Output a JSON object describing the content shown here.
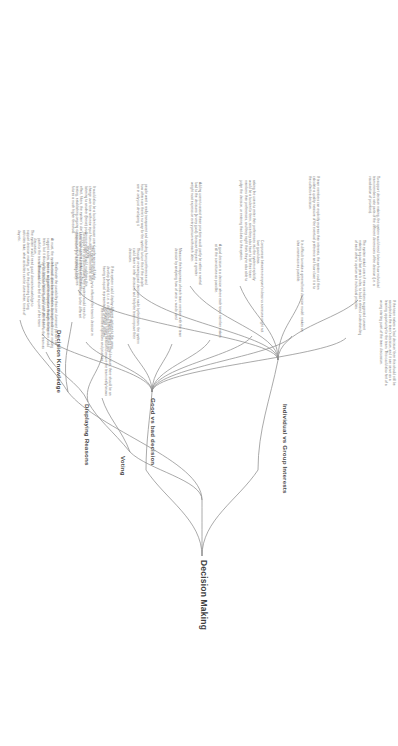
{
  "diagram": {
    "type": "mind-map",
    "orientation": "rotated-90-clockwise",
    "root": {
      "label": "Decision Making"
    },
    "branches": [
      {
        "id": "individual-vs-group",
        "label": "Individual vs Group Interests",
        "leaves": [
          "To support decision making, the system would need to know how individual team members rate parts of the different dimensions of the decision (i.e. a visualisation of priorities).",
          "If team members can explicitly express their interests, the system could then calculate a quality measure of the eventual preference and how close it is to the collective decision.",
          "asking the users to enter their preferences into the system explicitly would be a burden for them, since they also have to list their team members their preferences, and they might think they're also able to judge the decision, or entering that data to the system.",
          "Adding users to assist these priorities would partly be rather a mental load to the decisions (a very good). Because they are a greater weight most express on every person with each other.",
          "people want a really transparent and standing from preferences and how others are there's no way for the system to turn this if the people are in only just developing it.",
          "It would also be a burden because users' preferences will likely change over time with new input from other team members, and listening to another (these) problems everyone would modifying this effect, filters, the system's don't even look can be tracked and feature testing, establishing ongoing consensus onto the system's features futures a much higher threshold."
        ]
      },
      {
        "id": "good-vs-bad-decision",
        "label": "Good vs bad decision",
        "leaves": [
          "The system asked users if new members suggested consent making a good last year's rules, to build a shared understanding of each other's opinion and individual priorities.",
          "It is difficult to make a general best decision model: makes an idea unanimous as possible.",
          "Compromise between everyone's ideas vs someone might not love good ideas.",
          "A good decision is a decision where each team member makes at all the convictions as possible.",
          "Measure the happiness of each team member with the team decision by analysing how of once + words used",
          "Through reviewing past decisions made by the team, the system could learn to infer decisions and help the team improve their decisions.",
          "The system should not try to influence the team's decision in any way.",
          "At most, the system could question the team's decision, and suggest a idea, then i.e. suggest the alternative features to the team, but it also to the team's decision, and it can serve as a path for the team. This could also feel at a point of the team discussion.",
          "If the team makes a 'bad decision' then this should still be accepted as the team's decision, and it can serve as a learning opportunity for the team. This could also hint of a wrong starting point of the team discussion."
        ]
      },
      {
        "id": "decision-knowledge",
        "label": "Decision Knowledge",
        "leaves": [
          "The system would need good domain knowledge to support decision making, or for the planning how long activities take, what activities can be done when, times of day etc.",
          "To support the decision making, the system would need to know how much the different options relate to the different dimensions (i.e. advantageous)."
        ]
      },
      {
        "id": "displaying-reasons",
        "label": "Displaying Reasons",
        "leaves": [
          "To alleviate the possibility that one dominant person can influence other team members during the decision making process and push their opinion through, the system could try to calculate other options and offer them to the team as alternatives.",
          "If the system could display different options to the users, develop (artwork) it, i.e. a discussing different options and having an equal representation of those options."
        ]
      },
      {
        "id": "voting",
        "label": "Voting",
        "leaves": [
          "Before the team makes a final decision, there should be an anonymous voting session to ensure the team really knows the members opinions and priorities."
        ]
      }
    ]
  }
}
